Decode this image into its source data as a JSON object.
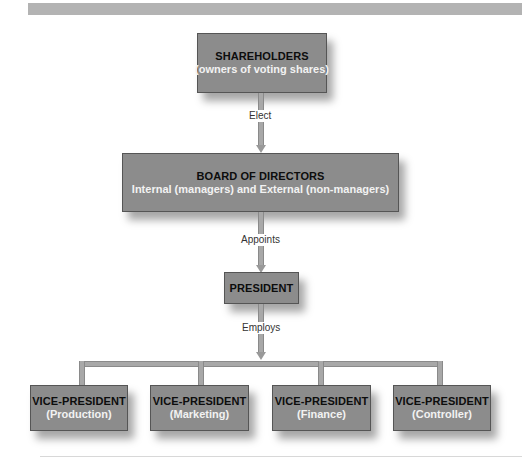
{
  "chart": {
    "type": "org-chart",
    "nodes": {
      "shareholders": {
        "title": "SHAREHOLDERS",
        "subtitle": "(owners of voting shares)"
      },
      "board": {
        "title": "BOARD OF DIRECTORS",
        "subtitle": "Internal (managers) and External (non-managers)"
      },
      "president": {
        "title": "PRESIDENT"
      },
      "vice_presidents": [
        {
          "title": "VICE-PRESIDENT",
          "subtitle": "(Production)"
        },
        {
          "title": "VICE-PRESIDENT",
          "subtitle": "(Marketing)"
        },
        {
          "title": "VICE-PRESIDENT",
          "subtitle": "(Finance)"
        },
        {
          "title": "VICE-PRESIDENT",
          "subtitle": "(Controller)"
        }
      ]
    },
    "edges": {
      "shareholders_to_board": "Elect",
      "board_to_president": "Appoints",
      "president_to_vps": "Employs"
    }
  },
  "colors": {
    "box_fill": "#8c8c8c",
    "box_border": "#555555",
    "connector": "#a8a8a8",
    "title_text": "#0d0d0d",
    "subtitle_text": "#f2f2f2",
    "top_band": "#b3b3b3"
  }
}
